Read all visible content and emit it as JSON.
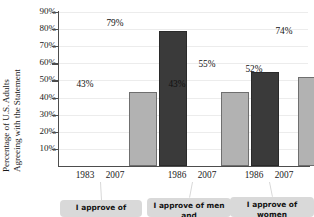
{
  "chart_data": {
    "type": "bar",
    "title": "",
    "xlabel": "",
    "ylabel": "Percentage of U.S. Adults Agreeing with the Statement",
    "ylabel_lines": [
      "Percentage of U.S. Adults",
      "Agreeing with the Statement"
    ],
    "ylim": [
      0,
      90
    ],
    "ytick_labels": [
      "90%",
      "80%",
      "70%",
      "60%",
      "50%",
      "40%",
      "30%",
      "20%",
      "10%"
    ],
    "ytick_values": [
      90,
      80,
      70,
      60,
      50,
      40,
      30,
      20,
      10
    ],
    "grid": true,
    "legend": "none",
    "categories": [
      "1983 2007",
      "1986 2007",
      "1986 2007"
    ],
    "groups": [
      {
        "xlabel_left": "1983",
        "xlabel_right": "2007",
        "callout": "I approve of",
        "bars": [
          {
            "year": "1983",
            "value": 43,
            "label": "43%",
            "color": "#b2b2b2"
          },
          {
            "year": "2007",
            "value": 79,
            "label": "79%",
            "color": "#3a3a3a"
          }
        ]
      },
      {
        "xlabel_left": "1986",
        "xlabel_right": "2007",
        "callout": "I approve of men and",
        "bars": [
          {
            "year": "1986",
            "value": 43,
            "label": "43%",
            "color": "#b2b2b2"
          },
          {
            "year": "2007",
            "value": 55,
            "label": "55%",
            "color": "#3a3a3a"
          }
        ]
      },
      {
        "xlabel_left": "1986",
        "xlabel_right": "2007",
        "callout": "I approve of women",
        "bars": [
          {
            "year": "1986",
            "value": 52,
            "label": "52%",
            "color": "#b2b2b2"
          },
          {
            "year": "2007",
            "value": 74,
            "label": "74%",
            "color": "#3a3a3a"
          }
        ]
      }
    ],
    "series": [
      {
        "name": "earlier year",
        "values": [
          43,
          43,
          52
        ],
        "color": "#b2b2b2"
      },
      {
        "name": "2007",
        "values": [
          79,
          55,
          74
        ],
        "color": "#3a3a3a"
      }
    ]
  },
  "colors": {
    "light_bar": "#b2b2b2",
    "dark_bar": "#3a3a3a",
    "axis": "#4d4d4d",
    "gridline": "#ececec",
    "callout_box": "#d9d9d9",
    "background": "#ffffff"
  }
}
